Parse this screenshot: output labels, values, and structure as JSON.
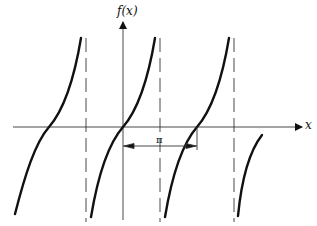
{
  "figure": {
    "function": "tan(x)",
    "y_axis_label": "f(x)",
    "x_axis_label": "x",
    "period_label": "π",
    "asymptote_style": "dashed",
    "colors": {
      "curve": "#111111",
      "axis": "#333333",
      "background": "#ffffff"
    }
  },
  "geometry": {
    "origin_px": [
      123,
      127
    ],
    "units_per_pi_px": 74,
    "asymptotes_px": [
      86,
      160,
      234
    ],
    "zeros_px": [
      49,
      123,
      197
    ]
  }
}
